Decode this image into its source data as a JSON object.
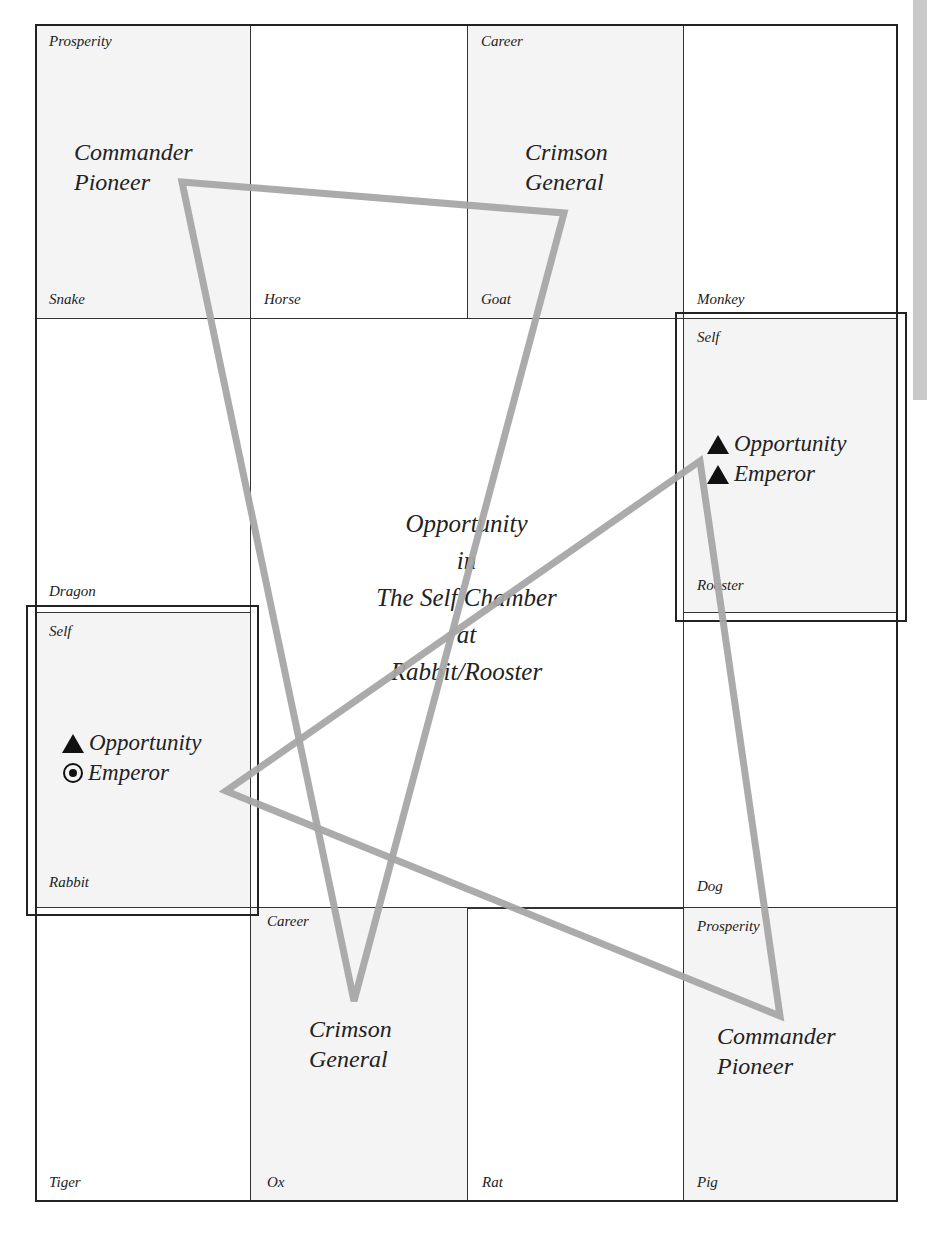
{
  "diagram": {
    "type": "chamber-chart",
    "center": {
      "lines": [
        "Opportunity",
        "in",
        "The Self Chamber",
        "at",
        "Rabbit/Rooster"
      ]
    },
    "cells": {
      "snake": {
        "top_label": "Prosperity",
        "bottom_label": "Snake",
        "content": [
          "Commander",
          "Pioneer"
        ]
      },
      "horse": {
        "bottom_label": "Horse"
      },
      "goat": {
        "top_label": "Career",
        "bottom_label": "Goat",
        "content": [
          "Crimson",
          "General"
        ]
      },
      "monkey": {
        "bottom_label": "Monkey"
      },
      "dragon": {
        "bottom_label": "Dragon"
      },
      "rooster": {
        "top_label": "Self",
        "bottom_label": "Rooster",
        "stars": [
          {
            "symbol": "triangle",
            "name": "Opportunity"
          },
          {
            "symbol": "triangle",
            "name": "Emperor"
          }
        ]
      },
      "rabbit": {
        "top_label": "Self",
        "bottom_label": "Rabbit",
        "stars": [
          {
            "symbol": "triangle",
            "name": "Opportunity"
          },
          {
            "symbol": "bullseye",
            "name": "Emperor"
          }
        ]
      },
      "dog": {
        "bottom_label": "Dog"
      },
      "tiger": {
        "bottom_label": "Tiger"
      },
      "ox": {
        "top_label": "Career",
        "bottom_label": "Ox",
        "content": [
          "Crimson",
          "General"
        ]
      },
      "rat": {
        "bottom_label": "Rat"
      },
      "pig": {
        "top_label": "Prosperity",
        "bottom_label": "Pig",
        "content": [
          "Commander",
          "Pioneer"
        ]
      }
    },
    "triangles": [
      {
        "name": "triangle-1",
        "points": [
          [
            182,
            182
          ],
          [
            564,
            213
          ],
          [
            354,
            1001
          ]
        ],
        "color": "#a6a6a6"
      },
      {
        "name": "triangle-2",
        "points": [
          [
            700,
            461
          ],
          [
            226,
            791
          ],
          [
            780,
            1016
          ]
        ],
        "color": "#a6a6a6"
      }
    ],
    "colors": {
      "border": "#222222",
      "shaded_cell": "#f4f4f4",
      "line": "#a6a6a6",
      "side_tab": "#c9c9c9"
    }
  }
}
